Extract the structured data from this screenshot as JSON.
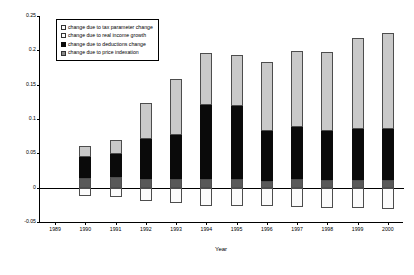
{
  "chart_data": {
    "type": "bar",
    "stacked": true,
    "title": "",
    "xlabel": "Year",
    "ylabel": "",
    "ylim": [
      -0.05,
      0.25
    ],
    "ytick_labels": [
      "0.25",
      "0.2",
      "0.15",
      "0.1",
      "0.05",
      "0",
      "-0.05"
    ],
    "ytick_values": [
      0.25,
      0.2,
      0.15,
      0.1,
      0.05,
      0,
      -0.05
    ],
    "grid": false,
    "legend_position": "top-left",
    "categories": [
      "1989",
      "1990",
      "1991",
      "1992",
      "1993",
      "1994",
      "1995",
      "1996",
      "1997",
      "1998",
      "1999",
      "2000"
    ],
    "series": [
      {
        "name": "change due to tax parameter change",
        "color": "#fbfbfb",
        "values": [
          0,
          -0.012,
          -0.014,
          -0.019,
          -0.023,
          -0.026,
          -0.026,
          -0.026,
          -0.028,
          -0.029,
          -0.03,
          -0.031
        ]
      },
      {
        "name": "change due to real income growth",
        "color": "#595959",
        "values": [
          0,
          0.014,
          0.015,
          0.013,
          0.013,
          0.013,
          0.012,
          0.01,
          0.013,
          0.011,
          0.011,
          0.011
        ]
      },
      {
        "name": "change due to deductions change",
        "color": "#0a0a0a",
        "values": [
          0,
          0.031,
          0.034,
          0.058,
          0.064,
          0.107,
          0.107,
          0.073,
          0.075,
          0.072,
          0.074,
          0.075
        ]
      },
      {
        "name": "change due to price indexation",
        "color": "#c9c9c9",
        "values": [
          0,
          0.015,
          0.021,
          0.053,
          0.081,
          0.076,
          0.074,
          0.1,
          0.111,
          0.114,
          0.133,
          0.139
        ]
      }
    ],
    "totals": [
      0,
      0.06,
      0.07,
      0.124,
      0.158,
      0.196,
      0.193,
      0.183,
      0.199,
      0.197,
      0.218,
      0.225
    ]
  },
  "legend": {
    "items": [
      {
        "label": "change due to tax parameter change",
        "swatch": "open-square-light"
      },
      {
        "label": "change due to real income growth",
        "swatch": "open-square-light"
      },
      {
        "label": "change due to deductions change",
        "swatch": "filled-square-black"
      },
      {
        "label": "change due to price indexation",
        "swatch": "filled-square-gray"
      }
    ]
  }
}
